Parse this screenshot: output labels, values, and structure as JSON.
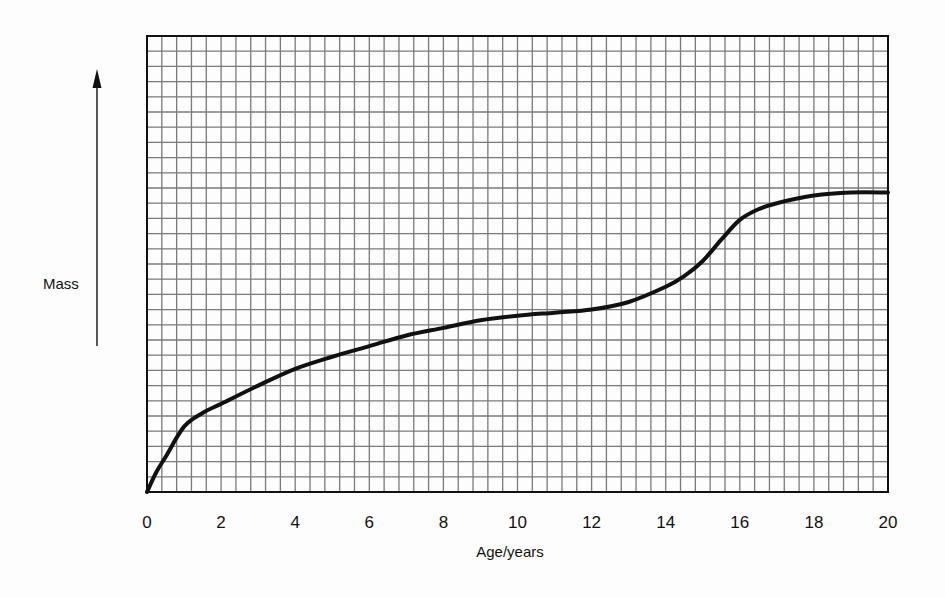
{
  "chart_data": {
    "type": "line",
    "title": "",
    "xlabel": "Age/years",
    "ylabel": "Mass",
    "ylabel_has_arrow": true,
    "y_units": "arbitrary (grid squares, no numeric scale shown)",
    "xlim": [
      0,
      20
    ],
    "ylim": [
      0,
      30
    ],
    "x_ticks": [
      0,
      2,
      4,
      6,
      8,
      10,
      12,
      14,
      16,
      18,
      20
    ],
    "x_tick_labels": [
      "0",
      "2",
      "4",
      "6",
      "8",
      "10",
      "12",
      "14",
      "16",
      "18",
      "20"
    ],
    "grid": true,
    "grid_squares_x": 50,
    "grid_squares_y": 30,
    "legend": null,
    "series": [
      {
        "name": "Mass",
        "color": "#111111",
        "x": [
          0,
          0.25,
          0.5,
          1,
          1.5,
          2,
          3,
          4,
          5,
          6,
          7,
          8,
          9,
          10,
          11,
          12,
          13,
          14,
          14.5,
          15,
          15.5,
          16,
          16.5,
          17,
          18,
          19,
          20
        ],
        "values": [
          0,
          1.3,
          2.3,
          4.3,
          5.2,
          5.8,
          7.0,
          8.1,
          8.9,
          9.6,
          10.3,
          10.8,
          11.3,
          11.6,
          11.8,
          12.0,
          12.5,
          13.5,
          14.2,
          15.2,
          16.6,
          17.9,
          18.6,
          19.0,
          19.5,
          19.7,
          19.7
        ]
      }
    ]
  },
  "labels": {
    "y_axis": "Mass",
    "x_axis": "Age/years"
  }
}
